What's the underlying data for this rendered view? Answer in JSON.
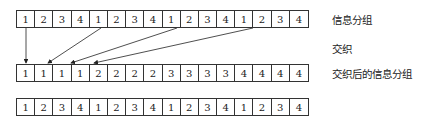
{
  "rows": {
    "original": [
      1,
      2,
      3,
      4,
      1,
      2,
      3,
      4,
      1,
      2,
      3,
      4,
      1,
      2,
      3,
      4
    ],
    "interleaved": [
      1,
      1,
      1,
      1,
      2,
      2,
      2,
      2,
      3,
      3,
      3,
      3,
      4,
      4,
      4,
      4
    ],
    "third": [
      1,
      2,
      3,
      4,
      1,
      2,
      3,
      4,
      1,
      2,
      3,
      4,
      1,
      2,
      3,
      4
    ]
  },
  "labels": {
    "original": "信息分组",
    "process": "交织",
    "interleaved": "交织后的信息分组"
  }
}
